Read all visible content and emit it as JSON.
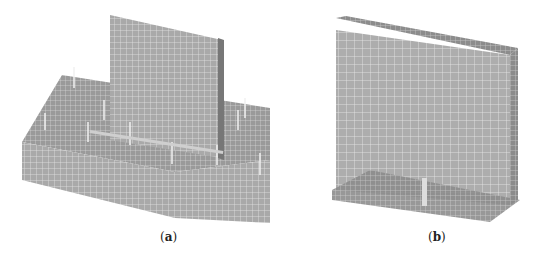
{
  "figure": {
    "panels": [
      {
        "id": "a",
        "label_open": "(",
        "label_letter": "a",
        "label_close": ")",
        "description": "foundation slab with wall and anchor bolts, FE mesh"
      },
      {
        "id": "b",
        "label_open": "(",
        "label_letter": "b",
        "label_close": ")",
        "description": "wall panel with rebar cage at base, FE mesh"
      }
    ],
    "colors": {
      "mesh_fill": "#a8a8a8",
      "mesh_line": "#e6e6e6",
      "dark_edge": "#6e6e6e"
    }
  }
}
